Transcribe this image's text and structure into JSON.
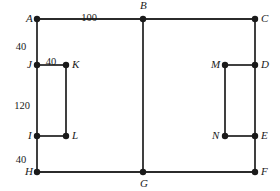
{
  "figure": {
    "width": 280,
    "height": 191,
    "stroke_color": "#2b2b2b",
    "vertex_color": "#1a1a1a",
    "background_color": "#ffffff",
    "line_width": 1.8,
    "vertex_radius": 3.2
  },
  "chart_data": {
    "type": "diagram",
    "title": "",
    "vertices": [
      {
        "id": "A",
        "label": "A",
        "x": 37,
        "y": 19,
        "label_dx": -11,
        "label_dy": -6
      },
      {
        "id": "B",
        "label": "B",
        "x": 143,
        "y": 19,
        "label_dx": -3,
        "label_dy": -19
      },
      {
        "id": "C",
        "label": "C",
        "x": 255,
        "y": 19,
        "label_dx": 6,
        "label_dy": -6
      },
      {
        "id": "D",
        "label": "D",
        "x": 255,
        "y": 65,
        "label_dx": 6,
        "label_dy": -6
      },
      {
        "id": "E",
        "label": "E",
        "x": 255,
        "y": 136,
        "label_dx": 6,
        "label_dy": -6
      },
      {
        "id": "F",
        "label": "F",
        "x": 255,
        "y": 172,
        "label_dx": 6,
        "label_dy": -6
      },
      {
        "id": "G",
        "label": "G",
        "x": 143,
        "y": 172,
        "label_dx": -3,
        "label_dy": 6
      },
      {
        "id": "H",
        "label": "H",
        "x": 37,
        "y": 172,
        "label_dx": -12,
        "label_dy": -6
      },
      {
        "id": "I",
        "label": "I",
        "x": 37,
        "y": 136,
        "label_dx": -9,
        "label_dy": -6
      },
      {
        "id": "J",
        "label": "J",
        "x": 37,
        "y": 65,
        "label_dx": -10,
        "label_dy": -6
      },
      {
        "id": "K",
        "label": "K",
        "x": 66,
        "y": 65,
        "label_dx": 6,
        "label_dy": -6
      },
      {
        "id": "L",
        "label": "L",
        "x": 66,
        "y": 136,
        "label_dx": 6,
        "label_dy": -6
      },
      {
        "id": "M",
        "label": "M",
        "x": 225,
        "y": 65,
        "label_dx": -14,
        "label_dy": -6
      },
      {
        "id": "N",
        "label": "N",
        "x": 225,
        "y": 136,
        "label_dx": -13,
        "label_dy": -6
      }
    ],
    "edges": [
      {
        "from": "A",
        "to": "C",
        "name": "edge-a-c"
      },
      {
        "from": "A",
        "to": "H",
        "name": "edge-a-h"
      },
      {
        "from": "H",
        "to": "F",
        "name": "edge-h-f"
      },
      {
        "from": "C",
        "to": "F",
        "name": "edge-c-f"
      },
      {
        "from": "B",
        "to": "G",
        "name": "edge-b-g"
      },
      {
        "from": "J",
        "to": "K",
        "name": "edge-j-k"
      },
      {
        "from": "K",
        "to": "L",
        "name": "edge-k-l"
      },
      {
        "from": "L",
        "to": "I",
        "name": "edge-l-i"
      },
      {
        "from": "M",
        "to": "D",
        "name": "edge-m-d"
      },
      {
        "from": "M",
        "to": "N",
        "name": "edge-m-n"
      },
      {
        "from": "N",
        "to": "E",
        "name": "edge-n-e"
      }
    ],
    "dimensions": [
      {
        "id": "dim-ab",
        "value": "100",
        "x": 89,
        "y": 13,
        "measures": "A to B",
        "align": "center"
      },
      {
        "id": "dim-aj",
        "value": "40",
        "x": 21,
        "y": 42,
        "measures": "A to J",
        "align": "center"
      },
      {
        "id": "dim-jk",
        "value": "40",
        "x": 51,
        "y": 57,
        "measures": "J to K",
        "align": "center"
      },
      {
        "id": "dim-ji",
        "value": "120",
        "x": 22,
        "y": 101,
        "measures": "J to I",
        "align": "center"
      },
      {
        "id": "dim-ih",
        "value": "40",
        "x": 21,
        "y": 155,
        "measures": "I to H",
        "align": "center"
      }
    ]
  }
}
